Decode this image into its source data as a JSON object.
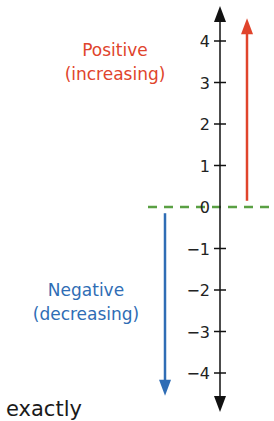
{
  "diagram": {
    "number_line": {
      "ticks": [
        {
          "value": 4,
          "label": "4"
        },
        {
          "value": 3,
          "label": "3"
        },
        {
          "value": 2,
          "label": "2"
        },
        {
          "value": 1,
          "label": "1"
        },
        {
          "value": 0,
          "label": "0"
        },
        {
          "value": -1,
          "label": "−1"
        },
        {
          "value": -2,
          "label": "−2"
        },
        {
          "value": -3,
          "label": "−3"
        },
        {
          "value": -4,
          "label": "−4"
        }
      ],
      "axis_color": "#111111",
      "zero_line_color": "#5aa043"
    },
    "positive": {
      "line1": "Positive",
      "line2": "(increasing)",
      "color": "#e0442c",
      "arrow_from": 0.15,
      "arrow_to": 4.5
    },
    "negative": {
      "line1": "Negative",
      "line2": "(decreasing)",
      "color": "#2f6db5",
      "arrow_from": -0.15,
      "arrow_to": -4.5
    },
    "footer_word": "exactly"
  }
}
